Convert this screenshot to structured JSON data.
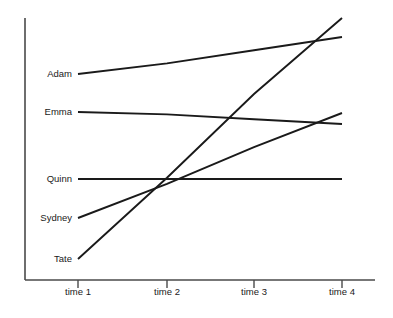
{
  "chart_data": {
    "type": "line",
    "title": "",
    "subtitle": "",
    "xlabel": "",
    "ylabel": "",
    "grid": false,
    "legend_position": "left-inline-labels",
    "categories": [
      "time 1",
      "time 2",
      "time 3",
      "time 4"
    ],
    "x": [
      1,
      2,
      3,
      4
    ],
    "xlim": [
      0.4,
      4.4
    ],
    "ylim": [
      0,
      100
    ],
    "axis_tick_labels_x": [
      "time 1",
      "time 2",
      "time 3",
      "time 4"
    ],
    "axis_tick_labels_y": [],
    "series": [
      {
        "name": "Adam",
        "label": "Adam",
        "values": [
          78,
          82,
          87,
          92
        ],
        "color": "#1a1a1a"
      },
      {
        "name": "Emma",
        "label": "Emma",
        "values": [
          64,
          63,
          61,
          59
        ],
        "color": "#1a1a1a"
      },
      {
        "name": "Quinn",
        "label": "Quinn",
        "values": [
          39,
          39,
          39,
          39
        ],
        "color": "#1a1a1a"
      },
      {
        "name": "Sydney",
        "label": "Sydney",
        "values": [
          24,
          37,
          51,
          64
        ],
        "color": "#1a1a1a"
      },
      {
        "name": "Tate",
        "label": "Tate",
        "values": [
          8,
          39,
          71,
          100
        ],
        "color": "#1a1a1a"
      }
    ]
  },
  "axes": {
    "x_axis_name": "x-axis",
    "y_axis_name": "y-axis"
  },
  "colors": {
    "line": "#1a1a1a",
    "axis": "#4a4a4a",
    "background": "#ffffff",
    "text": "#1a1a1a"
  },
  "geometry": {
    "width": 393,
    "height": 318,
    "plot_left": 25,
    "plot_right": 375,
    "plot_top": 18,
    "plot_bottom": 280,
    "tick_x": [
      78,
      167,
      254,
      342
    ],
    "label_x_right": 72,
    "tick_label_y": 288,
    "tick_mark_top": 280,
    "tick_mark_bottom": 288,
    "series_y_start": [
      74,
      112,
      179,
      218,
      259
    ],
    "series_y_end": [
      37,
      124,
      179,
      113,
      18
    ]
  }
}
